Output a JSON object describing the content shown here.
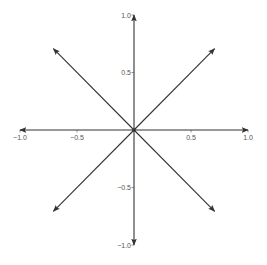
{
  "chart_data": {
    "type": "vector_field",
    "title": "",
    "xlabel": "",
    "ylabel": "",
    "xlim": [
      -1.0,
      1.0
    ],
    "ylim": [
      -1.0,
      1.0
    ],
    "grid": false,
    "legend": null,
    "origin": [
      0,
      0
    ],
    "vectors": [
      {
        "dx": 1.0,
        "dy": 0.0
      },
      {
        "dx": 0.707,
        "dy": 0.707
      },
      {
        "dx": 0.0,
        "dy": 1.0
      },
      {
        "dx": -0.707,
        "dy": 0.707
      },
      {
        "dx": -1.0,
        "dy": 0.0
      },
      {
        "dx": -0.707,
        "dy": -0.707
      },
      {
        "dx": 0.0,
        "dy": -1.0
      },
      {
        "dx": 0.707,
        "dy": -0.707
      }
    ],
    "x_ticks": [
      {
        "value": -1.0,
        "label": "−1.0"
      },
      {
        "value": -0.5,
        "label": "−0.5"
      },
      {
        "value": 0.5,
        "label": "0.5"
      },
      {
        "value": 1.0,
        "label": "1.0"
      }
    ],
    "y_ticks": [
      {
        "value": 1.0,
        "label": "1.0"
      },
      {
        "value": 0.5,
        "label": "0.5"
      },
      {
        "value": -0.5,
        "label": "−0.5"
      },
      {
        "value": -1.0,
        "label": "−1.0"
      }
    ],
    "colors": {
      "arrow": "#333333",
      "axis": "#555555",
      "text": "#555555"
    }
  }
}
